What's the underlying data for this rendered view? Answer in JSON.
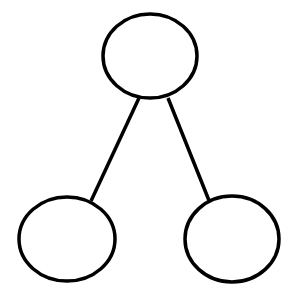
{
  "diagram": {
    "type": "tree",
    "background": "#ffffff",
    "stroke_color": "#000000",
    "stroke_width": 3.5,
    "nodes": [
      {
        "id": "root",
        "cx": 150,
        "cy": 56,
        "rx": 47,
        "ry": 42,
        "label": ""
      },
      {
        "id": "left-child",
        "cx": 67,
        "cy": 239,
        "rx": 48,
        "ry": 42,
        "label": ""
      },
      {
        "id": "right-child",
        "cx": 232,
        "cy": 239,
        "rx": 47,
        "ry": 43,
        "label": ""
      }
    ],
    "edges": [
      {
        "from": "root",
        "to": "left-child",
        "x1": 139,
        "y1": 98,
        "x2": 91,
        "y2": 201
      },
      {
        "from": "root",
        "to": "right-child",
        "x1": 168,
        "y1": 98,
        "x2": 212,
        "y2": 208
      }
    ]
  }
}
